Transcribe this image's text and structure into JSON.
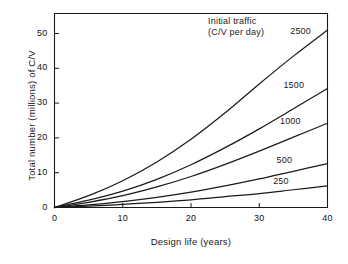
{
  "chart_data": {
    "type": "line",
    "title": "",
    "xlabel": "Design life (years)",
    "ylabel": "Total number (millions) of C/V",
    "xlim": [
      0,
      40
    ],
    "ylim": [
      0,
      55
    ],
    "xticks": [
      0,
      10,
      20,
      30,
      40
    ],
    "yticks": [
      0,
      10,
      20,
      30,
      40,
      50
    ],
    "xtick_labels": [
      "0",
      "10",
      "20",
      "30",
      "40"
    ],
    "ytick_labels": [
      "0",
      "10",
      "20",
      "30",
      "40",
      "50"
    ],
    "grid": false,
    "legend_position": "inline-curve-labels",
    "annotations": [
      {
        "text": "Initial traffic",
        "x": 22.5,
        "y": 53.5
      },
      {
        "text": "(C/V per day)",
        "x": 22.5,
        "y": 50.5
      }
    ],
    "x": [
      0,
      5,
      10,
      15,
      20,
      25,
      30,
      35,
      40
    ],
    "series": [
      {
        "name": "2500",
        "label": "2500",
        "label_x": 36.0,
        "label_y": 50.5,
        "values": [
          0,
          3.4,
          7.7,
          13.1,
          19.6,
          27.2,
          35.5,
          43.5,
          51.0
        ]
      },
      {
        "name": "1500",
        "label": "1500",
        "label_x": 35.0,
        "label_y": 34.8,
        "values": [
          0,
          2.1,
          4.7,
          8.1,
          12.3,
          17.2,
          22.6,
          28.4,
          34.2
        ]
      },
      {
        "name": "1000",
        "label": "1000",
        "label_x": 34.5,
        "label_y": 24.6,
        "values": [
          0,
          1.5,
          3.4,
          5.9,
          8.9,
          12.4,
          16.2,
          20.2,
          24.2
        ]
      },
      {
        "name": "500",
        "label": "500",
        "label_x": 34.0,
        "label_y": 13.4,
        "values": [
          0,
          0.75,
          1.7,
          2.9,
          4.4,
          6.2,
          8.2,
          10.4,
          12.6
        ]
      },
      {
        "name": "250",
        "label": "250",
        "label_x": 33.5,
        "label_y": 7.2,
        "values": [
          0,
          0.4,
          0.9,
          1.5,
          2.2,
          3.1,
          4.0,
          5.1,
          6.2
        ]
      }
    ],
    "colors": {
      "curve": "#1a1a1a",
      "axis": "#1a1a1a",
      "background": "#ffffff",
      "text": "#111111"
    }
  }
}
